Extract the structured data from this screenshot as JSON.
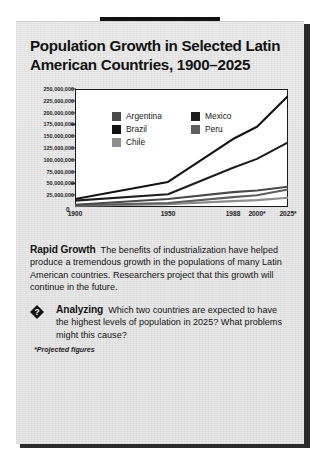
{
  "panel": {
    "title": "Population Growth in Selected Latin American Countries, 1900–2025",
    "footnote": "*Projected figures"
  },
  "chart_data": {
    "type": "line",
    "title": "Population Growth in Selected Latin American Countries, 1900–2025",
    "xlabel": "",
    "ylabel": "",
    "grid": false,
    "legend_position": "inside-top-left",
    "x": [
      "1900",
      "1950",
      "1988",
      "2000*",
      "2025*"
    ],
    "x_tick_labels": [
      "0",
      "1900",
      "1950",
      "1988",
      "2000*",
      "2025*"
    ],
    "xlim": [
      "1900",
      "2025"
    ],
    "ylim": [
      0,
      250000000
    ],
    "y_tick_labels": [
      "250,000,000",
      "225,000,000",
      "200,000,000",
      "175,000,000",
      "150,000,000",
      "125,000,000",
      "100,000,000",
      "75,000,000",
      "50,000,000",
      "25,000,000"
    ],
    "y_ticks": [
      250000000,
      225000000,
      200000000,
      175000000,
      150000000,
      125000000,
      100000000,
      75000000,
      50000000,
      25000000
    ],
    "series": [
      {
        "name": "Brazil",
        "color": "#121212",
        "values": [
          17000000,
          53000000,
          144000000,
          170000000,
          235000000
        ]
      },
      {
        "name": "Mexico",
        "color": "#1d1d1d",
        "values": [
          13500000,
          27000000,
          83000000,
          102000000,
          137000000
        ]
      },
      {
        "name": "Argentina",
        "color": "#4a4a4a",
        "values": [
          4800000,
          17000000,
          31500000,
          35000000,
          43000000
        ]
      },
      {
        "name": "Peru",
        "color": "#5e5e5e",
        "values": [
          3700000,
          8500000,
          21000000,
          25000000,
          37000000
        ]
      },
      {
        "name": "Chile",
        "color": "#8d8d8d",
        "values": [
          3000000,
          6000000,
          12500000,
          14500000,
          19500000
        ]
      }
    ],
    "legend": [
      {
        "label": "Argentina",
        "color": "#4a4a4a"
      },
      {
        "label": "Brazil",
        "color": "#121212"
      },
      {
        "label": "Chile",
        "color": "#8d8d8d"
      },
      {
        "label": "Mexico",
        "color": "#1d1d1d"
      },
      {
        "label": "Peru",
        "color": "#5e5e5e"
      }
    ]
  },
  "body": {
    "rapid_growth_head": "Rapid Growth",
    "rapid_growth_text": "The benefits of industrialization have helped produce a tremendous growth in the populations of many Latin American countries. Researchers project that this growth will continue in the future."
  },
  "analyzing": {
    "icon": "question-diamond-icon",
    "icon_glyph": "?",
    "head": "Analyzing",
    "text": "Which two countries are expected to have the highest levels of population in 2025? What problems might this cause?"
  }
}
